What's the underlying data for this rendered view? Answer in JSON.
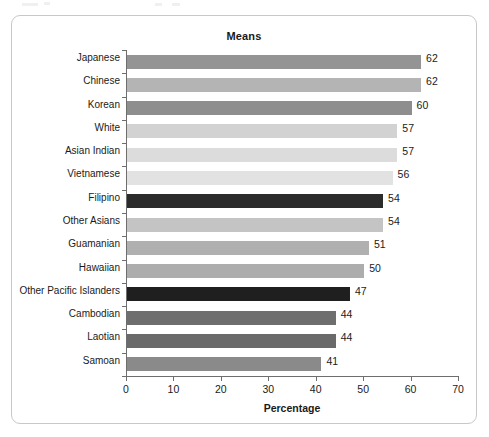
{
  "chart_data": {
    "type": "bar",
    "orientation": "horizontal",
    "title": "Means",
    "xlabel": "Percentage",
    "ylabel": "",
    "xlim": [
      0,
      70
    ],
    "xticks": [
      0,
      10,
      20,
      30,
      40,
      50,
      60,
      70
    ],
    "grid": false,
    "legend": null,
    "categories": [
      "Japanese",
      "Chinese",
      "Korean",
      "White",
      "Asian Indian",
      "Vietnamese",
      "Filipino",
      "Other Asians",
      "Guamanian",
      "Hawaiian",
      "Other Pacific Islanders",
      "Cambodian",
      "Laotian",
      "Samoan"
    ],
    "values": [
      62,
      62,
      60,
      57,
      57,
      56,
      54,
      54,
      51,
      50,
      47,
      44,
      44,
      41
    ],
    "bar_colors": [
      "#949494",
      "#b4b4b4",
      "#8e8e8e",
      "#d2d2d2",
      "#dcdcdc",
      "#e2e2e2",
      "#2b2b2b",
      "#c4c4c4",
      "#b0b0b0",
      "#adadad",
      "#1f1f1f",
      "#6e6e6e",
      "#6a6a6a",
      "#8a8a8a"
    ],
    "value_labels": [
      "62",
      "62",
      "60",
      "57",
      "57",
      "56",
      "54",
      "54",
      "51",
      "50",
      "47",
      "44",
      "44",
      "41"
    ],
    "xtick_labels": [
      "0",
      "10",
      "20",
      "30",
      "40",
      "50",
      "60",
      "70"
    ]
  },
  "frame": {
    "border_color": "#c8c8c8"
  }
}
